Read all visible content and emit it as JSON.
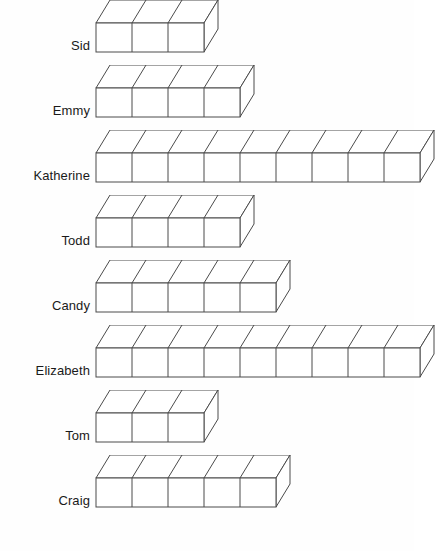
{
  "style": {
    "background_color": "#fefefe",
    "line_color": "#4a4a4a",
    "face_color": "#ffffff",
    "label_color": "#1a1a1a"
  },
  "geometry": {
    "cube_width": 36,
    "cube_face_height": 29,
    "depth_dx": 14,
    "depth_dy": 23,
    "row_spacing": 65,
    "first_row_top": 17,
    "chart_left": 96
  },
  "chart_data": {
    "type": "bar",
    "title": "",
    "subtitle": "",
    "xlabel": "",
    "ylabel": "",
    "orientation": "horizontal",
    "unit": "cubes",
    "grid": false,
    "legend": "none",
    "categories": [
      "Sid",
      "Emmy",
      "Katherine",
      "Todd",
      "Candy",
      "Elizabeth",
      "Tom",
      "Craig"
    ],
    "values": [
      3,
      4,
      9,
      4,
      5,
      9,
      3,
      5
    ],
    "xlim": [
      0,
      9
    ],
    "annotations": []
  },
  "rows": [
    {
      "label": "Sid",
      "count": 3
    },
    {
      "label": "Emmy",
      "count": 4
    },
    {
      "label": "Katherine",
      "count": 9
    },
    {
      "label": "Todd",
      "count": 4
    },
    {
      "label": "Candy",
      "count": 5
    },
    {
      "label": "Elizabeth",
      "count": 9
    },
    {
      "label": "Tom",
      "count": 3
    },
    {
      "label": "Craig",
      "count": 5
    }
  ]
}
